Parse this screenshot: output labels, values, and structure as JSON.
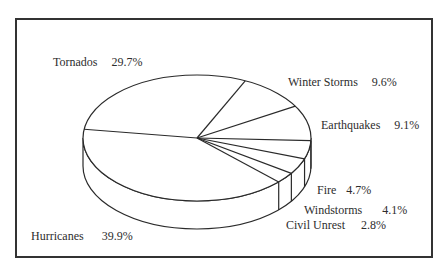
{
  "chart_data": {
    "type": "pie",
    "style": "3d",
    "title": "",
    "categories": [
      "Hurricanes",
      "Tornados",
      "Winter Storms",
      "Earthquakes",
      "Fire",
      "Windstorms",
      "Civil Unrest"
    ],
    "values": [
      39.9,
      29.7,
      9.6,
      9.1,
      4.7,
      4.1,
      2.8
    ],
    "unit": "%",
    "legend": "none (direct labels)",
    "labels": [
      {
        "name": "Tornados",
        "pct": "29.7%"
      },
      {
        "name": "Winter Storms",
        "pct": "9.6%"
      },
      {
        "name": "Earthquakes",
        "pct": "9.1%"
      },
      {
        "name": "Fire",
        "pct": "4.7%"
      },
      {
        "name": "Windstorms",
        "pct": "4.1%"
      },
      {
        "name": "Civil Unrest",
        "pct": "2.8%"
      },
      {
        "name": "Hurricanes",
        "pct": "39.9%"
      }
    ]
  },
  "colors": {
    "line": "#2a2a2a",
    "fill": "#ffffff",
    "frame": "#333333"
  }
}
